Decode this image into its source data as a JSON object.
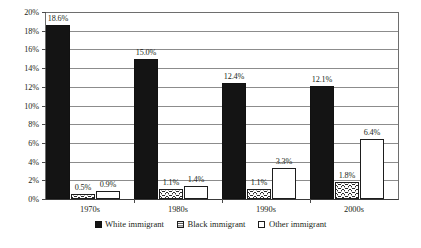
{
  "chart_data": {
    "type": "bar",
    "title": "",
    "subtitle": "",
    "xlabel": "",
    "ylabel": "",
    "categories": [
      "1970s",
      "1980s",
      "1990s",
      "2000s"
    ],
    "series": [
      {
        "name": "White immigrant",
        "values": [
          18.6,
          15.0,
          12.4,
          12.1
        ],
        "pattern": "solid-black",
        "color": "#141414"
      },
      {
        "name": "Black immigrant",
        "values": [
          0.5,
          1.1,
          1.1,
          1.8
        ],
        "pattern": "wavy-hatch",
        "color": "#2b2b2b"
      },
      {
        "name": "Other immigrant",
        "values": [
          0.9,
          1.4,
          3.3,
          6.4
        ],
        "pattern": "white-outline",
        "color": "#ffffff"
      }
    ],
    "data_labels": [
      [
        "18.6%",
        "15.0%",
        "12.4%",
        "12.1%"
      ],
      [
        "0.5%",
        "1.1%",
        "1.1%",
        "1.8%"
      ],
      [
        "0.9%",
        "1.4%",
        "3.3%",
        "6.4%"
      ]
    ],
    "ylim": [
      0,
      20
    ],
    "ytick_step": 2,
    "ytick_labels": [
      "20%",
      "18%",
      "16%",
      "14%",
      "12%",
      "10%",
      "8%",
      "6%",
      "4%",
      "2%",
      "0%"
    ],
    "ytick_values": [
      20,
      18,
      16,
      14,
      12,
      10,
      8,
      6,
      4,
      2,
      0
    ],
    "grid": true,
    "grid_axis": "y",
    "legend_position": "bottom",
    "value_unit": "percent"
  },
  "legend": {
    "items": [
      {
        "label": "White immigrant",
        "style": "white-imm"
      },
      {
        "label": "Black immigrant",
        "style": "black-imm"
      },
      {
        "label": "Other immigrant",
        "style": "other-imm"
      }
    ]
  },
  "caption": {
    "text": ""
  }
}
